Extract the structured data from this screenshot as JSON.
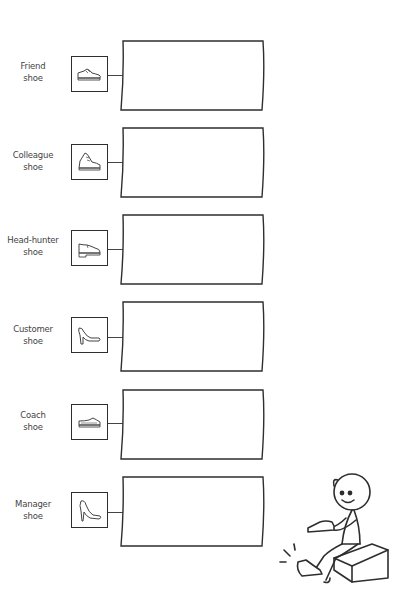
{
  "diagram": {
    "rows": [
      {
        "label_line1": "Friend",
        "label_line2": "shoe",
        "icon": "sneaker-icon"
      },
      {
        "label_line1": "Colleague",
        "label_line2": "shoe",
        "icon": "high-top-sneaker-icon"
      },
      {
        "label_line1": "Head-hunter",
        "label_line2": "shoe",
        "icon": "oxford-shoe-icon"
      },
      {
        "label_line1": "Customer",
        "label_line2": "shoe",
        "icon": "pump-heel-icon"
      },
      {
        "label_line1": "Coach",
        "label_line2": "shoe",
        "icon": "slip-on-shoe-icon"
      },
      {
        "label_line1": "Manager",
        "label_line2": "shoe",
        "icon": "stiletto-heel-icon"
      }
    ],
    "illustration": "stick-figure-trying-on-shoe-on-cube"
  },
  "colors": {
    "stroke": "#2e2e2e",
    "text": "#444444",
    "background": "#ffffff"
  }
}
